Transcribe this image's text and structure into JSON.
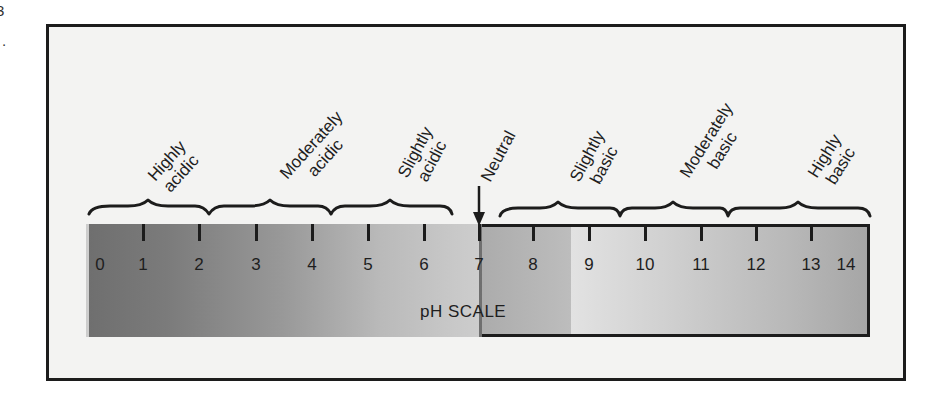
{
  "figure_fragment": {
    "text": "3\n."
  },
  "scale": {
    "title": "pH SCALE",
    "min": 0,
    "max": 14,
    "neutral_value": 7,
    "ticks": [
      "0",
      "1",
      "2",
      "3",
      "4",
      "5",
      "6",
      "7",
      "8",
      "9",
      "10",
      "11",
      "12",
      "13",
      "14"
    ]
  },
  "categories": [
    {
      "line1": "Highly",
      "line2": "acidic",
      "range": "0-2"
    },
    {
      "line1": "Moderately",
      "line2": "acidic",
      "range": "2-4"
    },
    {
      "line1": "Slightly",
      "line2": "acidic",
      "range": "4-7"
    },
    {
      "line1": "Neutral",
      "line2": "",
      "range": "7"
    },
    {
      "line1": "Slightly",
      "line2": "basic",
      "range": "7-10"
    },
    {
      "line1": "Moderately",
      "line2": "basic",
      "range": "10-12"
    },
    {
      "line1": "Highly",
      "line2": "basic",
      "range": "12-14"
    }
  ],
  "colors": {
    "frame_border": "#1c1c1c",
    "frame_background": "#f3f3f2",
    "acid_dark": "#6f6f6f",
    "acid_light": "#cdcdcd",
    "neutral": "#e6e6e6",
    "base_dark": "#a6a6a6"
  }
}
